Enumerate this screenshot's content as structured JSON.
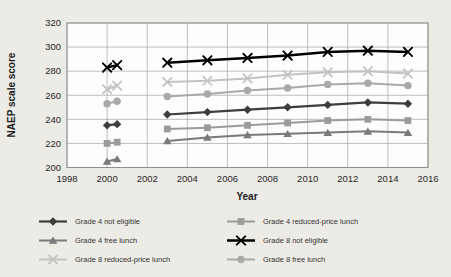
{
  "colors": {
    "page_background": "#edebe6",
    "plot_background": "#fdfdfd",
    "gridline": "#a3a3a3",
    "frame": "#8f8f8f",
    "tick_text": "#262626"
  },
  "chart_data": {
    "type": "line",
    "title": "",
    "xlabel": "Year",
    "ylabel": "NAEP scale score",
    "xlim": [
      1998,
      2016
    ],
    "ylim": [
      200,
      320
    ],
    "x_ticks": [
      1998,
      2000,
      2002,
      2004,
      2006,
      2008,
      2010,
      2012,
      2014,
      2016
    ],
    "y_ticks": [
      200,
      220,
      240,
      260,
      280,
      300,
      320
    ],
    "grid": "on",
    "legend_position": "bottom",
    "note_x_values": "two separate assessment points shown at 2000, line break until 2003",
    "x": [
      2000,
      2000.5,
      2003,
      2005,
      2007,
      2009,
      2011,
      2013,
      2015
    ],
    "gap_after_index": 1,
    "series": [
      {
        "name": "Grade 4 not eligible",
        "marker": "diamond",
        "color": "#3d3d3d",
        "line_width": 2.2,
        "values": [
          235,
          236,
          244,
          246,
          248,
          250,
          252,
          254,
          253
        ]
      },
      {
        "name": "Grade 4 reduced-price lunch",
        "marker": "square",
        "color": "#9b9b9b",
        "line_width": 2.0,
        "values": [
          220,
          221,
          232,
          233,
          235,
          237,
          239,
          240,
          239
        ]
      },
      {
        "name": "Grade 4 free lunch",
        "marker": "triangle",
        "color": "#7a7a7a",
        "line_width": 2.0,
        "values": [
          205,
          207,
          222,
          225,
          227,
          228,
          229,
          230,
          229
        ]
      },
      {
        "name": "Grade 8 not eligible",
        "marker": "x",
        "color": "#000000",
        "line_width": 2.5,
        "values": [
          283,
          285,
          287,
          289,
          291,
          293,
          296,
          297,
          296
        ]
      },
      {
        "name": "Grade 8 reduced-price lunch",
        "marker": "x",
        "color": "#c2c2c2",
        "line_width": 2.0,
        "values": [
          265,
          268,
          271,
          272,
          274,
          277,
          279,
          280,
          278
        ]
      },
      {
        "name": "Grade 8 free lunch",
        "marker": "circle",
        "color": "#a9a9a9",
        "line_width": 2.0,
        "values": [
          253,
          255,
          259,
          261,
          264,
          266,
          269,
          270,
          268
        ]
      }
    ]
  }
}
